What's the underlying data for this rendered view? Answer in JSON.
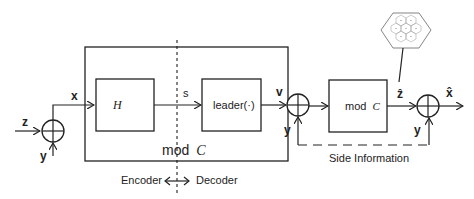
{
  "diagram": {
    "inputs": {
      "z": "z",
      "y_left": "y"
    },
    "signals": {
      "x": "x",
      "s": "s",
      "v": "v",
      "y_mid": "y",
      "z_hat": "ẑ",
      "y_right": "y",
      "x_hat": "x̂"
    },
    "blocks": {
      "H": "H",
      "leader": "leader(·)",
      "outer_mod": "mod",
      "outer_mod_sym": "C",
      "right_mod": "mod",
      "right_mod_sym": "C"
    },
    "annotations": {
      "encoder": "Encoder",
      "decoder": "Decoder",
      "side_information": "Side Information"
    },
    "colors": {
      "stroke": "#222222",
      "fill": "#ffffff",
      "lattice": "#888888"
    }
  }
}
